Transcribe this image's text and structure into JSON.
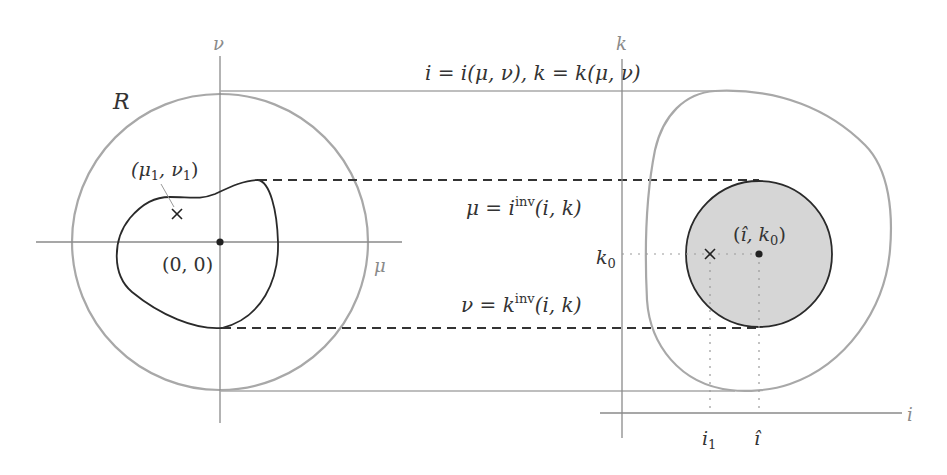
{
  "diagram": {
    "left_panel": {
      "region_label": "R",
      "axis_x_label": "μ",
      "axis_y_label": "ν",
      "origin_label": "(0, 0)",
      "point_label": "(μ",
      "point_label_sub1": "1",
      "point_label_mid": ", ν",
      "point_label_sub2": "1",
      "point_label_end": ")"
    },
    "right_panel": {
      "axis_x_label": "i",
      "axis_y_label": "k",
      "center_label_open": "(",
      "center_label_ihat": "î",
      "center_label_mid": ", k",
      "center_label_sub": "0",
      "center_label_close": ")",
      "k0_label": "k",
      "k0_sub": "0",
      "i1_label": "i",
      "i1_sub": "1",
      "ihat_label": "î"
    },
    "mapping_labels": {
      "forward": "i = i(μ, ν), k = k(μ, ν)",
      "mu_inverse_lhs": "μ = i",
      "mu_inverse_sup": "inv",
      "mu_inverse_rhs": "(i, k)",
      "nu_inverse_lhs": "ν = k",
      "nu_inverse_sup": "inv",
      "nu_inverse_rhs": "(i, k)"
    },
    "colors": {
      "axis": "#8a8a8a",
      "outer_region": "#a8a8a8",
      "curve": "#2a2a2a",
      "fill": "#d6d6d6",
      "dashed": "#333333",
      "dotted": "#9a9a9a"
    }
  }
}
